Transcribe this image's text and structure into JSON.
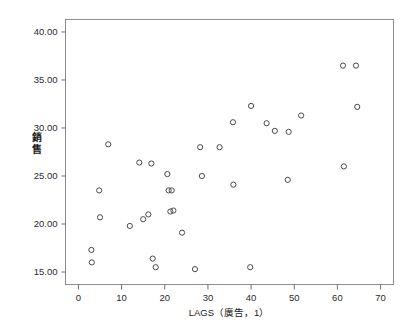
{
  "chart_data": {
    "type": "scatter",
    "title": "",
    "xlabel": "LAGS（廣告，1）",
    "ylabel": "銷售",
    "ylabel_chars": [
      "銷",
      "售"
    ],
    "xlim": [
      -3,
      73
    ],
    "ylim": [
      13.7,
      41.3
    ],
    "xticks": [
      0,
      10,
      20,
      30,
      40,
      50,
      60,
      70
    ],
    "xtick_labels": [
      "0",
      "10",
      "20",
      "30",
      "40",
      "50",
      "60",
      "70"
    ],
    "yticks": [
      15,
      20,
      25,
      30,
      35,
      40
    ],
    "ytick_labels": [
      "15.00",
      "20.00",
      "25.00",
      "30.00",
      "35.00",
      "40.00"
    ],
    "grid": false,
    "legend": false,
    "marker": "open-circle",
    "marker_color": "#4a4a4a",
    "points": [
      {
        "x": 3.0,
        "y": 17.3
      },
      {
        "x": 3.1,
        "y": 16.0
      },
      {
        "x": 4.8,
        "y": 23.5
      },
      {
        "x": 5.0,
        "y": 20.7
      },
      {
        "x": 6.9,
        "y": 28.3
      },
      {
        "x": 11.9,
        "y": 19.8
      },
      {
        "x": 14.1,
        "y": 26.4
      },
      {
        "x": 15.0,
        "y": 20.5
      },
      {
        "x": 16.2,
        "y": 21.0
      },
      {
        "x": 16.9,
        "y": 26.3
      },
      {
        "x": 17.2,
        "y": 16.4
      },
      {
        "x": 17.9,
        "y": 15.5
      },
      {
        "x": 20.6,
        "y": 25.2
      },
      {
        "x": 20.9,
        "y": 23.5
      },
      {
        "x": 21.3,
        "y": 21.3
      },
      {
        "x": 21.6,
        "y": 23.5
      },
      {
        "x": 22.0,
        "y": 21.4
      },
      {
        "x": 24.0,
        "y": 19.1
      },
      {
        "x": 27.0,
        "y": 15.3
      },
      {
        "x": 28.2,
        "y": 28.0
      },
      {
        "x": 28.6,
        "y": 25.0
      },
      {
        "x": 32.7,
        "y": 28.0
      },
      {
        "x": 35.8,
        "y": 30.6
      },
      {
        "x": 35.9,
        "y": 24.1
      },
      {
        "x": 39.8,
        "y": 15.5
      },
      {
        "x": 40.0,
        "y": 32.3
      },
      {
        "x": 43.6,
        "y": 30.5
      },
      {
        "x": 45.5,
        "y": 29.7
      },
      {
        "x": 48.5,
        "y": 24.6
      },
      {
        "x": 48.7,
        "y": 29.6
      },
      {
        "x": 51.6,
        "y": 31.3
      },
      {
        "x": 61.3,
        "y": 36.5
      },
      {
        "x": 61.5,
        "y": 26.0
      },
      {
        "x": 64.3,
        "y": 36.5
      },
      {
        "x": 64.6,
        "y": 32.2
      }
    ]
  }
}
